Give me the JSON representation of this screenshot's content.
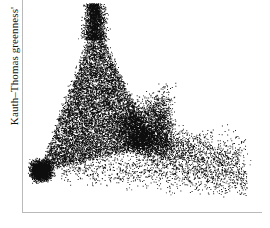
{
  "figure": {
    "background_color": "#ffffff",
    "point_color": "#0d0d0d",
    "axis_color": "#b9b9b9",
    "width": 270,
    "height": 228
  },
  "axes": {
    "y_axis_label": "Kauth–Thomas greenness'",
    "x_axis_label": "",
    "x_tick_labels": [],
    "y_tick_labels": [],
    "left_spine_visible": true,
    "bottom_spine_visible": true,
    "top_spine_visible": false,
    "right_spine_visible": false,
    "grid": false
  },
  "chart_data": {
    "type": "scatter",
    "title": "",
    "xlabel": "",
    "ylabel": "Kauth–Thomas greenness'",
    "xlim": [
      0,
      1
    ],
    "ylim": [
      0,
      1
    ],
    "grid": false,
    "legend": null,
    "marker_color": "#0d0d0d",
    "marker_size": 1,
    "n_points": 20000,
    "clusters": [
      {
        "name": "apex-spire",
        "cx": 0.3,
        "cy": 0.93,
        "sx": 0.022,
        "sy": 0.11,
        "n": 2100,
        "shape": "spire"
      },
      {
        "name": "dense-triangle-core",
        "cx": 0.27,
        "cy": 0.52,
        "sx": 0.085,
        "sy": 0.17,
        "n": 9000,
        "shape": "triangle"
      },
      {
        "name": "lower-left-vertex",
        "cx": 0.075,
        "cy": 0.195,
        "sx": 0.035,
        "sy": 0.038,
        "n": 2600,
        "shape": "blob"
      },
      {
        "name": "right-shoulder",
        "cx": 0.47,
        "cy": 0.4,
        "sx": 0.09,
        "sy": 0.1,
        "n": 3000,
        "shape": "fan"
      },
      {
        "name": "sparse-right-tail",
        "cx": 0.68,
        "cy": 0.27,
        "sx": 0.16,
        "sy": 0.09,
        "n": 2200,
        "shape": "tail"
      },
      {
        "name": "diffuse-lower-scatter",
        "cx": 0.55,
        "cy": 0.15,
        "sx": 0.22,
        "sy": 0.07,
        "n": 1100,
        "shape": "scatter"
      }
    ]
  }
}
